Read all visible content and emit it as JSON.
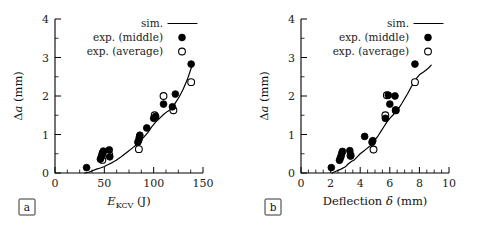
{
  "figure": {
    "background": "#ffffff",
    "ink": "#000000",
    "panels": [
      "a",
      "b"
    ]
  },
  "legend": {
    "position": "top-right-inside",
    "entries": [
      {
        "label": "sim.",
        "marker": "line"
      },
      {
        "label": "exp. (middle)",
        "marker": "filled-circle"
      },
      {
        "label": "exp. (average)",
        "marker": "open-circle"
      }
    ]
  },
  "panel_a": {
    "tag": "a",
    "ylabel_delta": "Δ",
    "ylabel_var": "a",
    "ylabel_unit": " (mm)",
    "xlabel_var": "E",
    "xlabel_sub": "KCV",
    "xlabel_unit": " (J)",
    "xticks": [
      "0",
      "50",
      "100",
      "150"
    ],
    "yticks": [
      "0",
      "1",
      "2",
      "3",
      "4"
    ]
  },
  "panel_b": {
    "tag": "b",
    "ylabel_delta": "Δ",
    "ylabel_var": "a",
    "ylabel_unit": " (mm)",
    "xlabel_text": "Deflection ",
    "xlabel_sym": "δ",
    "xlabel_unit": " (mm)",
    "xticks": [
      "0",
      "2",
      "4",
      "6",
      "8",
      "10"
    ],
    "yticks": [
      "0",
      "1",
      "2",
      "3",
      "4"
    ]
  },
  "chart_data": [
    {
      "type": "scatter",
      "panel": "a",
      "title": "",
      "xlabel": "E_KCV (J)",
      "ylabel": "Δa (mm)",
      "xlim": [
        0,
        150
      ],
      "ylim": [
        0,
        4
      ],
      "xticks": [
        0,
        50,
        100,
        150
      ],
      "yticks": [
        0,
        1,
        2,
        3,
        4
      ],
      "xminor_step": 12.5,
      "yminor_step": 0.5,
      "grid": false,
      "legend_position": "upper right inside",
      "series": [
        {
          "name": "exp. (middle)",
          "marker": "filled-circle",
          "points": [
            [
              32,
              0.14
            ],
            [
              46,
              0.36
            ],
            [
              47,
              0.42
            ],
            [
              47.5,
              0.46
            ],
            [
              48,
              0.52
            ],
            [
              49,
              0.57
            ],
            [
              55,
              0.6
            ],
            [
              55.5,
              0.42
            ],
            [
              84,
              0.8
            ],
            [
              85,
              0.86
            ],
            [
              85.5,
              0.93
            ],
            [
              86,
              0.98
            ],
            [
              93,
              1.17
            ],
            [
              100,
              1.42
            ],
            [
              102,
              1.47
            ],
            [
              110,
              1.79
            ],
            [
              119,
              1.72
            ],
            [
              122,
              2.05
            ],
            [
              138,
              2.83
            ]
          ]
        },
        {
          "name": "exp. (average)",
          "marker": "open-circle",
          "points": [
            [
              48,
              0.34
            ],
            [
              55,
              0.47
            ],
            [
              85,
              0.62
            ],
            [
              101,
              1.5
            ],
            [
              110,
              2.0
            ],
            [
              120,
              1.63
            ],
            [
              138,
              2.36
            ]
          ]
        },
        {
          "name": "sim.",
          "marker": "line",
          "points": [
            [
              30,
              0.0
            ],
            [
              34,
              0.02
            ],
            [
              38,
              0.06
            ],
            [
              42,
              0.1
            ],
            [
              46,
              0.13
            ],
            [
              50,
              0.17
            ],
            [
              54,
              0.22
            ],
            [
              58,
              0.27
            ],
            [
              62,
              0.33
            ],
            [
              66,
              0.4
            ],
            [
              70,
              0.48
            ],
            [
              74,
              0.56
            ],
            [
              78,
              0.64
            ],
            [
              82,
              0.72
            ],
            [
              86,
              0.82
            ],
            [
              90,
              0.93
            ],
            [
              94,
              1.05
            ],
            [
              98,
              1.2
            ],
            [
              102,
              1.32
            ],
            [
              106,
              1.42
            ],
            [
              110,
              1.52
            ],
            [
              114,
              1.6
            ],
            [
              118,
              1.66
            ],
            [
              122,
              1.82
            ],
            [
              126,
              1.98
            ],
            [
              130,
              2.18
            ],
            [
              134,
              2.42
            ],
            [
              138,
              2.72
            ],
            [
              140,
              2.84
            ]
          ]
        }
      ]
    },
    {
      "type": "scatter",
      "panel": "b",
      "title": "",
      "xlabel": "Deflection δ (mm)",
      "ylabel": "Δa (mm)",
      "xlim": [
        0,
        10
      ],
      "ylim": [
        0,
        4
      ],
      "xticks": [
        0,
        2,
        4,
        6,
        8,
        10
      ],
      "yticks": [
        0,
        1,
        2,
        3,
        4
      ],
      "xminor_step": 0.5,
      "yminor_step": 0.5,
      "grid": false,
      "legend_position": "upper right inside",
      "series": [
        {
          "name": "exp. (middle)",
          "marker": "filled-circle",
          "points": [
            [
              2.05,
              0.14
            ],
            [
              2.6,
              0.33
            ],
            [
              2.65,
              0.38
            ],
            [
              2.7,
              0.43
            ],
            [
              2.75,
              0.5
            ],
            [
              2.8,
              0.56
            ],
            [
              3.3,
              0.58
            ],
            [
              3.35,
              0.44
            ],
            [
              4.3,
              0.95
            ],
            [
              4.8,
              0.8
            ],
            [
              4.85,
              0.84
            ],
            [
              5.7,
              1.42
            ],
            [
              5.9,
              2.02
            ],
            [
              6.0,
              1.79
            ],
            [
              6.35,
              2.0
            ],
            [
              6.4,
              1.63
            ],
            [
              7.7,
              2.83
            ]
          ]
        },
        {
          "name": "exp. (average)",
          "marker": "open-circle",
          "points": [
            [
              3.35,
              0.46
            ],
            [
              4.9,
              0.61
            ],
            [
              5.7,
              1.5
            ],
            [
              5.8,
              2.02
            ],
            [
              6.4,
              1.63
            ],
            [
              7.7,
              2.36
            ]
          ]
        },
        {
          "name": "sim.",
          "marker": "line",
          "points": [
            [
              2.1,
              0.0
            ],
            [
              2.4,
              0.05
            ],
            [
              2.7,
              0.1
            ],
            [
              3.0,
              0.16
            ],
            [
              3.2,
              0.24
            ],
            [
              3.4,
              0.3
            ],
            [
              3.6,
              0.34
            ],
            [
              3.8,
              0.42
            ],
            [
              4.0,
              0.5
            ],
            [
              4.2,
              0.56
            ],
            [
              4.4,
              0.62
            ],
            [
              4.6,
              0.68
            ],
            [
              4.8,
              0.76
            ],
            [
              5.0,
              0.86
            ],
            [
              5.2,
              0.96
            ],
            [
              5.4,
              1.08
            ],
            [
              5.6,
              1.2
            ],
            [
              5.8,
              1.32
            ],
            [
              6.0,
              1.42
            ],
            [
              6.2,
              1.5
            ],
            [
              6.4,
              1.58
            ],
            [
              6.6,
              1.68
            ],
            [
              6.8,
              1.8
            ],
            [
              7.0,
              1.93
            ],
            [
              7.2,
              2.06
            ],
            [
              7.4,
              2.2
            ],
            [
              7.6,
              2.34
            ],
            [
              7.8,
              2.46
            ],
            [
              8.0,
              2.55
            ],
            [
              8.3,
              2.63
            ],
            [
              8.6,
              2.72
            ],
            [
              8.8,
              2.8
            ]
          ]
        }
      ]
    }
  ]
}
